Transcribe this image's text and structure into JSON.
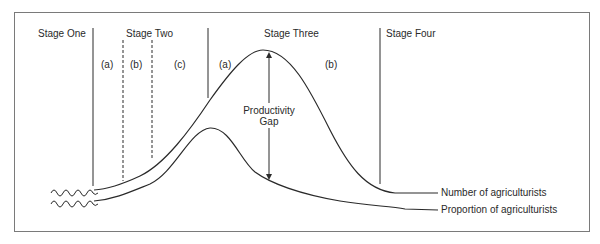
{
  "diagram": {
    "stages": [
      {
        "label": "Stage One"
      },
      {
        "label": "Stage Two",
        "substages": [
          "(a)",
          "(b)",
          "(c)"
        ]
      },
      {
        "label": "Stage Three",
        "substages": [
          "(a)",
          "(b)"
        ]
      },
      {
        "label": "Stage Four"
      }
    ],
    "annotation": {
      "line1": "Productivity",
      "line2": "Gap"
    },
    "curves": [
      {
        "label": "Number of agriculturists"
      },
      {
        "label": "Proportion of agriculturists"
      }
    ],
    "colors": {
      "line": "#2a2a2a",
      "frame": "#7a7a7a",
      "background": "#ffffff"
    }
  }
}
